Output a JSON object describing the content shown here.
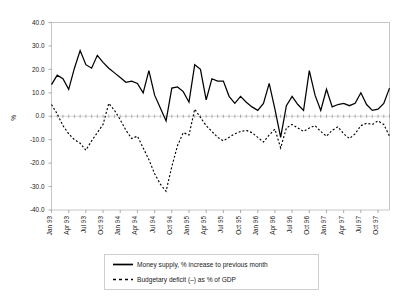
{
  "chart_data": {
    "type": "line",
    "title": "",
    "xlabel": "",
    "ylabel": "%",
    "ylim": [
      -40.0,
      40.0
    ],
    "ytick_step": 10.0,
    "ytick_labels": [
      "40.0",
      "30.0",
      "20.0",
      "10.0",
      "0.0",
      "-10.0",
      "-20.0",
      "-30.0",
      "-40.0"
    ],
    "ytick_values": [
      40.0,
      30.0,
      20.0,
      10.0,
      0.0,
      -10.0,
      -20.0,
      -30.0,
      -40.0
    ],
    "grid": false,
    "legend_position": "bottom-center",
    "x_tick_labels": [
      "Jan 93",
      "Apr 93",
      "Jul 93",
      "Oct 93",
      "Jan 94",
      "Apr 94",
      "Jul 94",
      "Oct 94",
      "Jan 95",
      "Apr 95",
      "Jul 95",
      "Oct 95",
      "Jan 96",
      "Apr 96",
      "Jul 96",
      "Oct 96",
      "Jan 97",
      "Apr 97",
      "Jul 97",
      "Oct 97"
    ],
    "x_tick_interval_months": 3,
    "x_points_count": 60,
    "series": [
      {
        "name": "Money supply, % increase to previous month",
        "style": "solid",
        "color": "#000000",
        "values": [
          13.5,
          17.5,
          16.0,
          11.5,
          20.5,
          28.0,
          22.0,
          20.5,
          26.0,
          23.0,
          20.5,
          18.5,
          16.5,
          14.5,
          15.0,
          14.0,
          10.0,
          19.5,
          9.0,
          3.5,
          -2.0,
          12.0,
          12.5,
          10.5,
          6.0,
          22.0,
          20.0,
          7.0,
          16.0,
          15.0,
          15.0,
          8.5,
          5.5,
          8.5,
          6.0,
          4.0,
          2.5,
          5.5,
          14.0,
          3.0,
          -9.0,
          4.5,
          8.5,
          5.0,
          2.5,
          19.5,
          9.0,
          2.5,
          11.5,
          4.0,
          5.0,
          5.5,
          4.5,
          5.5,
          10.0,
          5.0,
          2.5,
          3.0,
          5.5,
          12.0
        ]
      },
      {
        "name": "Budgetary deficit (–) as % of GDP",
        "style": "dashed",
        "color": "#000000",
        "values": [
          5.0,
          1.0,
          -4.0,
          -7.5,
          -10.0,
          -11.5,
          -14.5,
          -10.5,
          -7.0,
          -3.5,
          5.5,
          2.5,
          -1.5,
          -6.0,
          -9.5,
          -8.5,
          -13.5,
          -18.5,
          -24.5,
          -29.0,
          -32.0,
          -21.5,
          -12.5,
          -7.0,
          -8.0,
          3.0,
          -0.5,
          -4.0,
          -6.5,
          -9.0,
          -10.5,
          -9.0,
          -7.5,
          -6.5,
          -6.0,
          -7.0,
          -9.0,
          -11.0,
          -8.0,
          -5.5,
          -13.5,
          -5.0,
          -3.5,
          -5.0,
          -6.5,
          -5.0,
          -4.0,
          -6.5,
          -8.5,
          -6.0,
          -4.5,
          -7.5,
          -9.5,
          -7.5,
          -4.0,
          -3.0,
          -3.5,
          -2.0,
          -3.5,
          -8.5
        ]
      }
    ]
  },
  "legend": {
    "items": [
      {
        "label": "Money supply, % increase to previous month",
        "style": "solid"
      },
      {
        "label": "Budgetary deficit (–) as % of GDP",
        "style": "dashed"
      }
    ]
  },
  "axis": {
    "y_title": "%"
  }
}
